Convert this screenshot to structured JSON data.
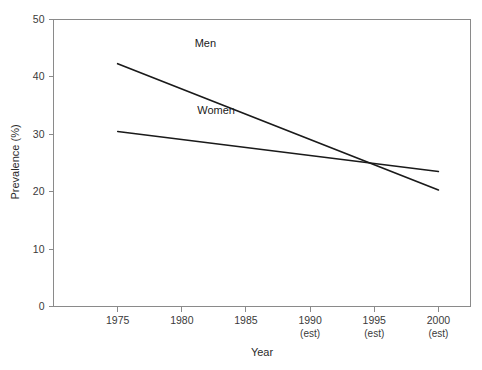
{
  "chart_data": {
    "type": "line",
    "title": "",
    "xlabel": "Year",
    "ylabel": "Prevalence (%)",
    "xlim": [
      1970,
      2002.5
    ],
    "ylim": [
      0,
      50
    ],
    "grid": false,
    "legend": "inline-labels",
    "x": [
      1975,
      2000
    ],
    "xticks": [
      {
        "value": 1975,
        "label": "1975",
        "sublabel": ""
      },
      {
        "value": 1980,
        "label": "1980",
        "sublabel": ""
      },
      {
        "value": 1985,
        "label": "1985",
        "sublabel": ""
      },
      {
        "value": 1990,
        "label": "1990",
        "sublabel": "(est)"
      },
      {
        "value": 1995,
        "label": "1995",
        "sublabel": "(est)"
      },
      {
        "value": 2000,
        "label": "2000",
        "sublabel": "(est)"
      }
    ],
    "yticks": [
      {
        "value": 0,
        "label": "0"
      },
      {
        "value": 10,
        "label": "10"
      },
      {
        "value": 20,
        "label": "20"
      },
      {
        "value": 30,
        "label": "30"
      },
      {
        "value": 40,
        "label": "40"
      },
      {
        "value": 50,
        "label": "50"
      }
    ],
    "series": [
      {
        "name": "Men",
        "label": "Men",
        "color": "#1a1a1a",
        "x": [
          1975,
          2000
        ],
        "values": [
          42.3,
          20.3
        ],
        "label_x": 1981.0,
        "label_y": 45.2
      },
      {
        "name": "Women",
        "label": "Women",
        "color": "#1a1a1a",
        "x": [
          1975,
          2000
        ],
        "values": [
          30.5,
          23.5
        ],
        "label_x": 1981.2,
        "label_y": 33.6
      }
    ],
    "annotations": [
      {
        "text": "Lines cross at approximately 1995 at 25%"
      }
    ]
  },
  "axes": {
    "x_title": "Year",
    "y_title": "Prevalence (%)"
  },
  "colors": {
    "frame": "#8a8a8a",
    "line": "#1a1a1a",
    "text": "#2b2b2b",
    "background": "#ffffff"
  }
}
